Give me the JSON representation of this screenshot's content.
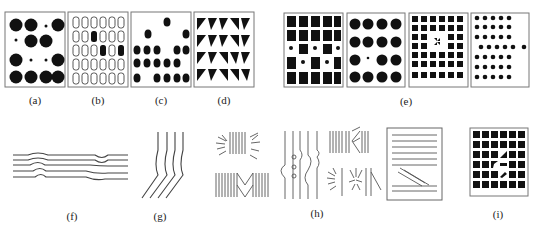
{
  "figure": {
    "panels": [
      {
        "id": "a",
        "label": "(a)",
        "description": "grid of large black dots with some replaced by small dots"
      },
      {
        "id": "b",
        "label": "(b)",
        "description": "grid of outlined rounded rectangles with a few filled black"
      },
      {
        "id": "c",
        "label": "(c)",
        "description": "hexagonal dots with missing positions forming a gap"
      },
      {
        "id": "d",
        "label": "(d)",
        "description": "grid of black triangles with varying orientation"
      },
      {
        "id": "e",
        "label": "(e)",
        "description": "four texture patterns: squares, circles, small squares with pinwheel, dots with offset"
      },
      {
        "id": "f",
        "label": "(f)",
        "description": "parallel horizontal wavy lines"
      },
      {
        "id": "g",
        "label": "(g)",
        "description": "parallel lines bending from vertical to diagonal"
      },
      {
        "id": "h",
        "label": "(h)",
        "description": "line texture groupings: radial bursts, vertical hatching, chevrons, bulges"
      },
      {
        "id": "i",
        "label": "(i)",
        "description": "grid of black squares with distorted center elements"
      }
    ]
  },
  "colors": {
    "ink": "#111111",
    "frame": "#777777",
    "background": "#ffffff"
  }
}
